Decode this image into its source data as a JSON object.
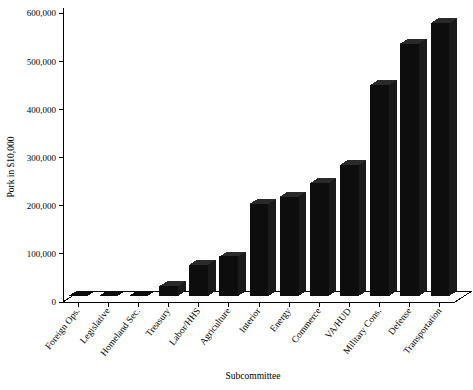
{
  "chart_data": {
    "type": "bar",
    "title": "",
    "subtitle": "",
    "xlabel": "Subcommittee",
    "ylabel": "Pork in $10,000",
    "categories": [
      "Foreign Ops.",
      "Legislative",
      "Homeland Sec.",
      "Treasury",
      "Labor/HHS",
      "Agriculture",
      "Interior",
      "Energy",
      "Commerce",
      "VA/HUD",
      "Military Cons.",
      "Defense",
      "Transportation"
    ],
    "values": [
      0,
      0,
      0,
      20000,
      65000,
      82000,
      191000,
      206000,
      234000,
      272000,
      438000,
      524000,
      566000
    ],
    "ylim": [
      0,
      600000
    ],
    "ytick_values": [
      0,
      100000,
      200000,
      300000,
      400000,
      500000,
      600000
    ],
    "ytick_labels": [
      "0",
      "100,000",
      "200,000",
      "300,000",
      "400,000",
      "500,000",
      "600,000"
    ],
    "grid": false,
    "legend": null,
    "legend_position": "none",
    "series": [
      {
        "name": "Pork",
        "values": [
          0,
          0,
          0,
          20000,
          65000,
          82000,
          191000,
          206000,
          234000,
          272000,
          438000,
          524000,
          566000
        ]
      }
    ],
    "style": {
      "bar_color": "#0d0d0d",
      "background": "#ffffff",
      "axis_color": "#000000",
      "three_d": true
    }
  },
  "axis": {
    "y_title": "Pork in $10,000",
    "x_title": "Subcommittee"
  }
}
